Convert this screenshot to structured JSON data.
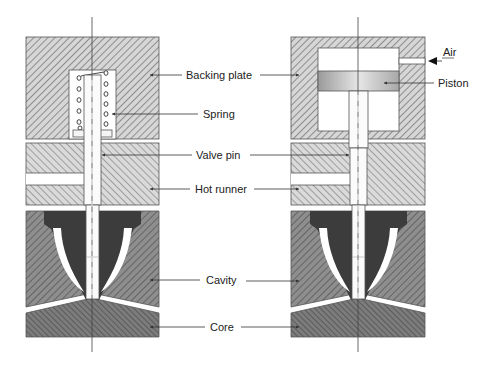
{
  "figure": {
    "type": "cross-section diagram",
    "panels": [
      {
        "id": "left",
        "actuation": "spring"
      },
      {
        "id": "right",
        "actuation": "pneumatic piston"
      }
    ]
  },
  "labels": {
    "backing_plate": "Backing plate",
    "spring": "Spring",
    "valve_pin": "Valve pin",
    "hot_runner": "Hot runner",
    "cavity": "Cavity",
    "core": "Core",
    "air": "Air",
    "piston": "Piston"
  },
  "colors": {
    "background": "#ffffff",
    "plate_hatch_light": "#d8d8d8",
    "cavity_fill": "#8c8c8c",
    "core_fill": "#7a7a7a",
    "nozzle_fill": "#3c3c3c",
    "piston_gradient_edge": "#9a9a9a",
    "piston_gradient_center": "#e4e4e4",
    "line": "#333333"
  }
}
